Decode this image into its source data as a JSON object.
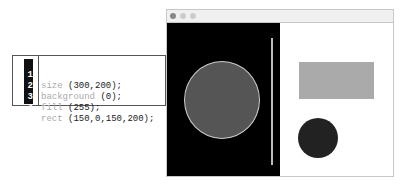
{
  "code_editor": {
    "lines": [
      {
        "number": "1",
        "keyword": "size",
        "args": " (300,200);"
      },
      {
        "number": "2",
        "keyword": "background",
        "args": " (0);"
      },
      {
        "number": "3",
        "keyword": "fill",
        "args": " (255);"
      },
      {
        "number": "4",
        "keyword": "rect",
        "args": " (150,0,150,200);"
      }
    ]
  },
  "window": {
    "titlebar_buttons": [
      "close",
      "minimize",
      "maximize"
    ],
    "colors": {
      "titlebar_dot_1": "#888888",
      "titlebar_dot_2": "#cccccc",
      "titlebar_dot_3": "#cccccc"
    }
  },
  "canvas": {
    "left_background": "#000000",
    "right_background": "#ffffff",
    "shapes": [
      {
        "type": "circle",
        "fill": "#555555",
        "stroke": "#cccccc"
      },
      {
        "type": "line",
        "color": "#bbbbbb"
      },
      {
        "type": "rect",
        "fill": "#aaaaaa"
      },
      {
        "type": "circle",
        "fill": "#222222"
      }
    ]
  }
}
